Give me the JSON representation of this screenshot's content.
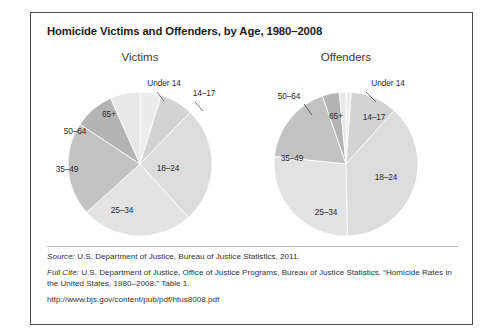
{
  "chart_data": {
    "type": "pie",
    "title": "Homicide Victims and Offenders, by Age, 1980–2008",
    "categories": [
      "Under 14",
      "14–17",
      "18–24",
      "25–34",
      "35–49",
      "50–64",
      "65+"
    ],
    "legend_position": "none",
    "grid": false,
    "series": [
      {
        "name": "Victims",
        "values": [
          4.8,
          7.5,
          26.0,
          25.0,
          21.0,
          9.0,
          6.7
        ],
        "start_angle": 0,
        "direction": "clockwise"
      },
      {
        "name": "Offenders",
        "values": [
          1.2,
          10.5,
          38.0,
          27.0,
          18.0,
          3.8,
          1.5
        ],
        "start_angle": 0,
        "direction": "clockwise"
      }
    ],
    "slice_colors": {
      "Under 14": "#ececec",
      "14–17": "#d3d3d3",
      "18–24": "#dcdcdc",
      "25–34": "#e3e3e3",
      "35–49": "#c2c2c2",
      "50–64": "#b4b4b4",
      "65+": "#e8e8e8"
    },
    "xlabel": "",
    "ylabel": ""
  },
  "panels": {
    "victims": {
      "title": "Victims",
      "labels": [
        {
          "text": "Under 14",
          "x": 127,
          "y": 32,
          "leader": {
            "x1": 120,
            "y1": 41,
            "x2": 127,
            "y2": 50
          }
        },
        {
          "text": "14–17",
          "x": 167,
          "y": 42,
          "leader": {
            "x1": 158,
            "y1": 51,
            "x2": 166,
            "y2": 60
          }
        },
        {
          "text": "18–24",
          "x": 131,
          "y": 117,
          "leader": null
        },
        {
          "text": "25–34",
          "x": 85,
          "y": 159,
          "leader": null
        },
        {
          "text": "35–49",
          "x": 30,
          "y": 118,
          "leader": null
        },
        {
          "text": "50–64",
          "x": 38,
          "y": 80,
          "leader": null
        },
        {
          "text": "65+",
          "x": 72,
          "y": 63,
          "leader": null
        }
      ]
    },
    "offenders": {
      "title": "Offenders",
      "labels": [
        {
          "text": "Under 14",
          "x": 145,
          "y": 32,
          "leader": {
            "x1": 123,
            "y1": 41,
            "x2": 133,
            "y2": 51
          }
        },
        {
          "text": "50–64",
          "x": 46,
          "y": 45,
          "leader": {
            "x1": 61,
            "y1": 53,
            "x2": 69,
            "y2": 64
          }
        },
        {
          "text": "65+",
          "x": 93,
          "y": 65,
          "leader": null
        },
        {
          "text": "14–17",
          "x": 131,
          "y": 66,
          "leader": null
        },
        {
          "text": "18–24",
          "x": 143,
          "y": 126,
          "leader": null
        },
        {
          "text": "25–34",
          "x": 83,
          "y": 161,
          "leader": null
        },
        {
          "text": "35–49",
          "x": 49,
          "y": 107,
          "leader": null
        }
      ]
    }
  },
  "footnotes": {
    "source_label": "Source:",
    "source_text": " U.S. Department of Justice, Bureau of Justice Statistics, 2011.",
    "fullcite_label": "Full Cite:",
    "fullcite_text": " U.S. Department of Justice, Office of Justice Programs, Bureau of Justice Statistics. “Homicide Rates in the United States, 1980–2008.” Table 1.",
    "url": "http://www.bjs.gov/content/pub/pdf/htus8008.pdf"
  }
}
